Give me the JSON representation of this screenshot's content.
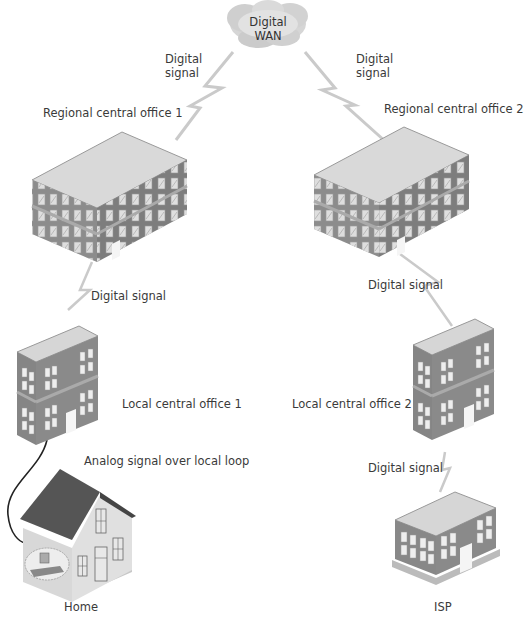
{
  "diagram": {
    "type": "network-topology",
    "nodes": [
      {
        "id": "wan",
        "label_line1": "Digital",
        "label_line2": "WAN",
        "shape": "cloud"
      },
      {
        "id": "rco1",
        "label": "Regional central office 1",
        "shape": "large-building"
      },
      {
        "id": "rco2",
        "label": "Regional central office 2",
        "shape": "large-building"
      },
      {
        "id": "lco1",
        "label": "Local central office 1",
        "shape": "small-building"
      },
      {
        "id": "lco2",
        "label": "Local central office 2",
        "shape": "small-building"
      },
      {
        "id": "home",
        "label": "Home",
        "shape": "house"
      },
      {
        "id": "isp",
        "label": "ISP",
        "shape": "low-building"
      }
    ],
    "edges": [
      {
        "from": "wan",
        "to": "rco1",
        "label_line1": "Digital",
        "label_line2": "signal",
        "style": "lightning"
      },
      {
        "from": "wan",
        "to": "rco2",
        "label_line1": "Digital",
        "label_line2": "signal",
        "style": "lightning"
      },
      {
        "from": "rco1",
        "to": "lco1",
        "label": "Digital signal",
        "style": "lightning"
      },
      {
        "from": "rco2",
        "to": "lco2",
        "label": "Digital signal",
        "style": "lightning"
      },
      {
        "from": "lco2",
        "to": "isp",
        "label": "Digital signal",
        "style": "lightning"
      },
      {
        "from": "lco1",
        "to": "home",
        "label": "Analog signal over local loop",
        "style": "curved-wire"
      }
    ]
  },
  "colors": {
    "building_wall": "#8a8a8a",
    "building_roof": "#d4d4d4",
    "window": "#ededed",
    "link": "#c8c8c8",
    "house_roof": "#555555",
    "text": "#3a3a3a"
  }
}
